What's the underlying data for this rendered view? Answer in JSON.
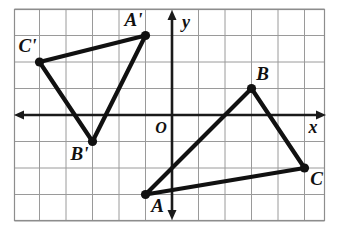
{
  "figure": {
    "origin_label": "O",
    "x_axis_label": "x",
    "y_axis_label": "y"
  },
  "colors": {
    "grid": "#9a9a9a",
    "frame": "#8d8d8d",
    "axis": "#1a1a1a",
    "figure_stroke": "#111111",
    "background": "#ffffff"
  },
  "chart_data": {
    "type": "scatter",
    "xlabel": "x",
    "ylabel": "y",
    "xlim": [
      -6,
      6
    ],
    "ylim": [
      -4,
      4
    ],
    "grid": true,
    "grid_step": 1,
    "legend": "none",
    "origin_label": "O",
    "series": [
      {
        "name": "Triangle ABC",
        "closed": true,
        "points": [
          {
            "label": "A",
            "x": -1,
            "y": -3,
            "label_pos": "below-right"
          },
          {
            "label": "B",
            "x": 3,
            "y": 1,
            "label_pos": "above-right"
          },
          {
            "label": "C",
            "x": 5,
            "y": -2,
            "label_pos": "below-right"
          }
        ]
      },
      {
        "name": "Triangle A'B'C'",
        "closed": true,
        "points": [
          {
            "label": "A'",
            "x": -1,
            "y": 3,
            "label_pos": "above-left"
          },
          {
            "label": "B'",
            "x": -3,
            "y": -1,
            "label_pos": "below-left"
          },
          {
            "label": "C'",
            "x": -5,
            "y": 2,
            "label_pos": "above-left"
          }
        ]
      }
    ],
    "annotations": [
      {
        "text": "O",
        "x": -0.4,
        "y": -0.45
      },
      {
        "text": "x",
        "x": 5.6,
        "y": -0.55
      },
      {
        "text": "y",
        "x": 0.45,
        "y": 3.75
      }
    ]
  },
  "labels": {
    "A": "A",
    "B": "B",
    "C": "C",
    "A_prime": "A'",
    "B_prime": "B'",
    "C_prime": "C'"
  }
}
